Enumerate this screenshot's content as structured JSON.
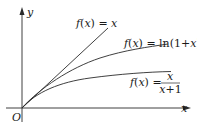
{
  "diagram": {
    "title": "",
    "axes": {
      "x_label": "x",
      "y_label": "y",
      "origin_label": "O"
    },
    "curves": [
      {
        "name": "identity",
        "label_prefix": "f(x) = ",
        "label_expr": "x",
        "label_full": "f(x) = x"
      },
      {
        "name": "log",
        "label_prefix": "f(x) = ",
        "label_expr": "ln(1+x)",
        "label_full": "f(x) = ln(1+x)"
      },
      {
        "name": "rational",
        "label_prefix": "f(x) = ",
        "numerator": "x",
        "denominator": "x+1",
        "label_full": "f(x) = x/(x+1)"
      }
    ],
    "colors": {
      "line": "#2a2a2a",
      "background": "#ffffff"
    }
  }
}
